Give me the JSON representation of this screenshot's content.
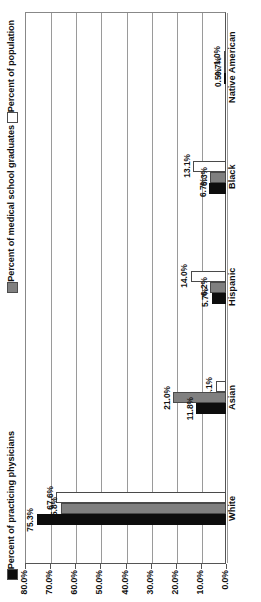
{
  "legend": {
    "entries": [
      {
        "label": "Percent of practicing physicians",
        "swatch": "#0d0d0d",
        "name": "legend-practicing-physicians"
      },
      {
        "label": "Percent of medical school graduates",
        "swatch": "#808080",
        "name": "legend-medical-school-graduates"
      },
      {
        "label": "Percent of population",
        "swatch": "#ffffff",
        "name": "legend-population"
      }
    ]
  },
  "axis": {
    "tick_labels": [
      "80.0%",
      "70.0%",
      "60.0%",
      "50.0%",
      "40.0%",
      "30.0%",
      "20.0%",
      "10.0%",
      "0.0%"
    ]
  },
  "chart_data": {
    "type": "bar",
    "orientation": "horizontal",
    "title": "",
    "xlabel": "",
    "ylabel": "",
    "xlim": [
      0,
      80
    ],
    "grid": true,
    "legend_position": "left",
    "categories": [
      "White",
      "Asian",
      "Hispanic",
      "Black",
      "Native American"
    ],
    "series": [
      {
        "name": "Percent of practicing physicians",
        "color": "#0d0d0d",
        "values": [
          75.3,
          11.8,
          5.7,
          6.7,
          0.5
        ],
        "labels": [
          "75.3%",
          "11.8%",
          "5.7%",
          "6.7%",
          "0.5%"
        ]
      },
      {
        "name": "Percent of medical school graduates",
        "color": "#808080",
        "values": [
          65.8,
          21.0,
          6.2,
          6.3,
          0.7
        ],
        "labels": [
          "65.8%",
          "21.0%",
          "6.2%",
          "6.3%",
          "0.7%"
        ]
      },
      {
        "name": "Percent of population",
        "color": "#ffffff",
        "values": [
          67.6,
          4.1,
          14.0,
          13.1,
          1.0
        ],
        "labels": [
          "67.6%",
          "4.1%",
          "14.0%",
          "13.1%",
          "1.0%"
        ]
      }
    ]
  }
}
